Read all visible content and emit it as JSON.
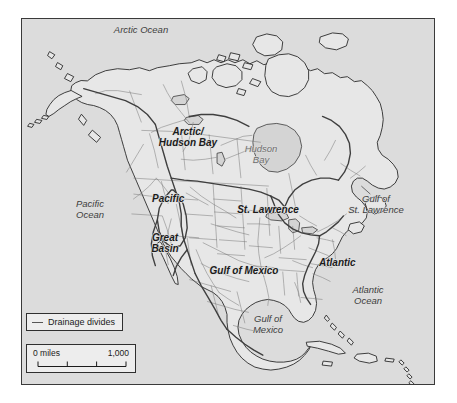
{
  "figure": {
    "kind": "thematic-map",
    "frame_border_color": "#3a3a3a",
    "ocean_color": "#dcdcdc",
    "land_color": "#e6e6e6",
    "coastline_color": "#2b2b2b",
    "boundary_color": "#6a6a6a",
    "divide_color": "#4a4a4a",
    "river_color": "#8a8a8a"
  },
  "basin_labels": [
    {
      "id": "arctic-hudson-bay",
      "text": "Arctic/\nHudson Bay",
      "line1": "Arctic/",
      "line2": "Hudson Bay",
      "x": 186,
      "y": 128
    },
    {
      "id": "pacific",
      "text": "Pacific",
      "x": 150,
      "y": 198
    },
    {
      "id": "st-lawrence",
      "text": "St. Lawrence",
      "x": 266,
      "y": 209
    },
    {
      "id": "great-basin",
      "text": "Great\nBasin",
      "line1": "Great",
      "line2": "Basin",
      "x": 163,
      "y": 237
    },
    {
      "id": "gulf-of-mexico-basin",
      "text": "Gulf of Mexico",
      "x": 206,
      "y": 264
    },
    {
      "id": "atlantic",
      "text": "Atlantic",
      "x": 317,
      "y": 256
    }
  ],
  "water_labels": [
    {
      "id": "arctic-ocean",
      "text": "Arctic Ocean",
      "x": 178,
      "y": 31,
      "dark": true
    },
    {
      "id": "hudson-bay",
      "text": "Hudson\nBay",
      "line1": "Hudson",
      "line2": "Bay",
      "x": 259,
      "y": 152
    },
    {
      "id": "pacific-ocean",
      "text": "Pacific\nOcean",
      "line1": "Pacific",
      "line2": "Ocean",
      "x": 88,
      "y": 206,
      "dark": true
    },
    {
      "id": "gulf-of-st-lawrence",
      "text": "Gulf of\nSt. Lawrence",
      "line1": "Gulf of",
      "line2": "St. Lawrence",
      "x": 374,
      "y": 193,
      "dark": true
    },
    {
      "id": "gulf-of-mexico-water",
      "text": "Gulf of\nMexico",
      "line1": "Gulf of",
      "line2": "Mexico",
      "x": 264,
      "y": 314,
      "dark": true
    },
    {
      "id": "atlantic-ocean",
      "text": "Atlantic\nOcean",
      "line1": "Atlantic",
      "line2": "Ocean",
      "x": 365,
      "y": 285,
      "dark": true
    }
  ],
  "legend": {
    "symbol": "line-swatch-icon",
    "label": "Drainage divides"
  },
  "scale": {
    "left_label": "0 miles",
    "right_label": "1,000",
    "tick_count": 4
  }
}
